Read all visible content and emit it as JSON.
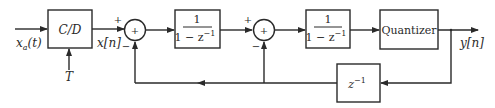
{
  "diagram": {
    "input_label": "x",
    "input_sub": "a",
    "input_arg": "(t)",
    "cd_block": "C/D",
    "sampling_label": "T",
    "xn_label": "x[n]",
    "sum1": {
      "symbol": "+",
      "plus": "+",
      "minus": "−"
    },
    "integrator1": {
      "num": "1",
      "den": "1 − z",
      "den_exp": "−1"
    },
    "sum2": {
      "symbol": "+",
      "plus": "+",
      "minus": "−"
    },
    "integrator2": {
      "num": "1",
      "den": "1 − z",
      "den_exp": "−1"
    },
    "quantizer": "Quantizer",
    "delay": {
      "base": "z",
      "exp": "−1"
    },
    "output_label": "y[n]",
    "colors": {
      "line": "#2a2a2a",
      "background": "#ffffff"
    }
  }
}
